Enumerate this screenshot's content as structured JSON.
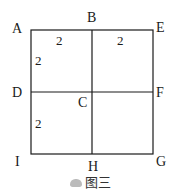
{
  "figure": {
    "caption": "图三",
    "points": {
      "A": "A",
      "B": "B",
      "E": "E",
      "D": "D",
      "C": "C",
      "F": "F",
      "I": "I",
      "H": "H",
      "G": "G"
    },
    "segment_labels": {
      "AB": "2",
      "BE": "2",
      "AD": "2",
      "DI": "2"
    },
    "line_color": "#1a1a1a"
  }
}
